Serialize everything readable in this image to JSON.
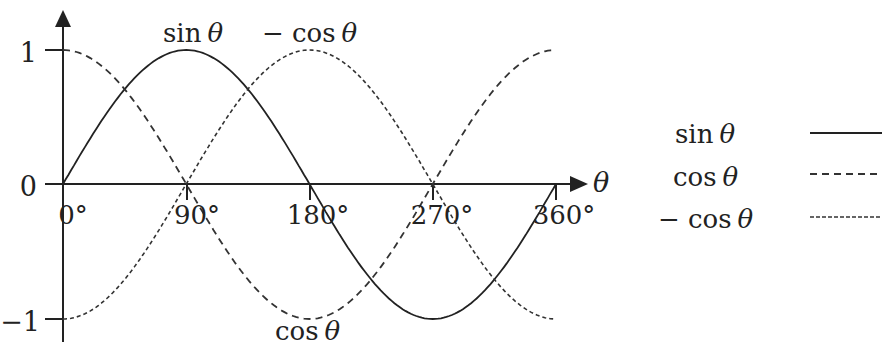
{
  "chart_data": {
    "type": "line",
    "title": "",
    "xlabel": "θ",
    "ylabel": "",
    "x_ticks": [
      "0°",
      "90°",
      "180°",
      "270°",
      "360°"
    ],
    "y_ticks": [
      "1",
      "0",
      "−1"
    ],
    "xlim": [
      0,
      360
    ],
    "ylim": [
      -1,
      1
    ],
    "grid": false,
    "legend_position": "right",
    "x": [
      0,
      45,
      90,
      135,
      180,
      225,
      270,
      315,
      360
    ],
    "series": [
      {
        "name": "sin θ",
        "style": "solid",
        "values": [
          0,
          0.707,
          1,
          0.707,
          0,
          -0.707,
          -1,
          -0.707,
          0
        ]
      },
      {
        "name": "cos θ",
        "style": "dashed",
        "values": [
          1,
          0.707,
          0,
          -0.707,
          -1,
          -0.707,
          0,
          0.707,
          1
        ]
      },
      {
        "name": "− cos θ",
        "style": "dotted",
        "values": [
          -1,
          -0.707,
          0,
          0.707,
          1,
          0.707,
          0,
          -0.707,
          -1
        ]
      }
    ],
    "annotations": [
      {
        "text": "sin θ",
        "near": "peak of sin at 90°"
      },
      {
        "text": "− cos θ",
        "near": "peak of −cos at 180°"
      },
      {
        "text": "cos θ",
        "near": "trough of cos at 180°"
      }
    ]
  },
  "labels": {
    "y_1": "1",
    "y_0": "0",
    "y_neg1": "−1",
    "x_0": "0°",
    "x_90": "90°",
    "x_180": "180°",
    "x_270": "270°",
    "x_360": "360°",
    "x_axis": "θ",
    "curve_sin_func": "sin",
    "curve_negcos_func": "− cos",
    "curve_cos_func": "cos",
    "theta": "θ"
  },
  "legend": {
    "items": [
      {
        "func": "sin",
        "var": "θ",
        "style": "solid"
      },
      {
        "func": "cos",
        "var": "θ",
        "style": "dashed"
      },
      {
        "func": "− cos",
        "var": "θ",
        "style": "dotted"
      }
    ]
  },
  "colors": {
    "line": "#222222",
    "background": "#ffffff"
  }
}
